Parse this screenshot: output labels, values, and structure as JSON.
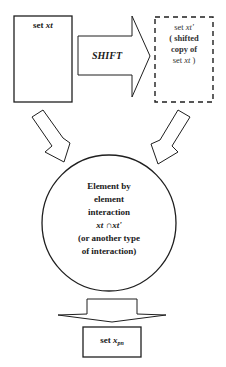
{
  "diagram": {
    "colors": {
      "stroke": "#1f1f1f",
      "text": "#1a1a1a",
      "background": "#ffffff"
    },
    "source_box": {
      "prefix": "set ",
      "var": "xt"
    },
    "shift_arrow": {
      "label": "SHIFT"
    },
    "shifted_box": {
      "line1_prefix": "set ",
      "line1_var": "xt'",
      "line2": "( shifted",
      "line3": "copy of",
      "line4_prefix": "set ",
      "line4_var": "xt",
      "line4_suffix": " )"
    },
    "interaction_circle": {
      "line1": "Element by",
      "line2": "element",
      "line3": "interaction",
      "formula_left": "xt",
      "formula_op": " ∩",
      "formula_right": "xt'",
      "line5": "(or another type",
      "line6": "of interaction)"
    },
    "result_box": {
      "prefix": "set ",
      "var": "x",
      "subscript": "pn"
    }
  }
}
